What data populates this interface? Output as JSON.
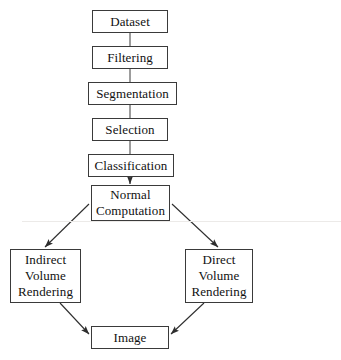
{
  "diagram": {
    "type": "flowchart",
    "background_color": "#ffffff",
    "line_color": "#3a3a3a",
    "text_color": "#111111",
    "nodes": [
      {
        "id": "dataset",
        "lines": [
          "Dataset"
        ]
      },
      {
        "id": "filtering",
        "lines": [
          "Filtering"
        ]
      },
      {
        "id": "segmentation",
        "lines": [
          "Segmentation"
        ]
      },
      {
        "id": "selection",
        "lines": [
          "Selection"
        ]
      },
      {
        "id": "classification",
        "lines": [
          "Classification"
        ]
      },
      {
        "id": "normal",
        "lines": [
          "Normal",
          "Computation"
        ]
      },
      {
        "id": "indirect",
        "lines": [
          "Indirect",
          "Volume",
          "Rendering"
        ]
      },
      {
        "id": "direct",
        "lines": [
          "Direct",
          "Volume",
          "Rendering"
        ]
      },
      {
        "id": "image",
        "lines": [
          "Image"
        ]
      }
    ],
    "edges": [
      {
        "from": "dataset",
        "to": "filtering",
        "arrowhead": false
      },
      {
        "from": "filtering",
        "to": "segmentation",
        "arrowhead": false
      },
      {
        "from": "segmentation",
        "to": "selection",
        "arrowhead": false
      },
      {
        "from": "selection",
        "to": "classification",
        "arrowhead": false
      },
      {
        "from": "classification",
        "to": "normal",
        "arrowhead": true
      },
      {
        "from": "normal",
        "to": "indirect",
        "arrowhead": true
      },
      {
        "from": "normal",
        "to": "direct",
        "arrowhead": true
      },
      {
        "from": "indirect",
        "to": "image",
        "arrowhead": true
      },
      {
        "from": "direct",
        "to": "image",
        "arrowhead": true
      }
    ]
  }
}
